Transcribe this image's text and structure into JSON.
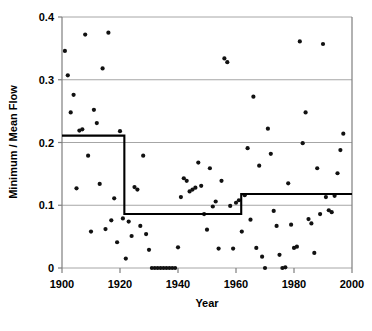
{
  "chart_data": {
    "type": "scatter",
    "title": "",
    "xlabel": "Year",
    "ylabel": "Minimum / Mean Flow",
    "xlim": [
      1900,
      2000
    ],
    "ylim": [
      0,
      0.4
    ],
    "xticks": [
      "1900",
      "1920",
      "1940",
      "1960",
      "1980",
      "2000"
    ],
    "xtick_values": [
      1900,
      1920,
      1940,
      1960,
      1980,
      2000
    ],
    "yticks": [
      "0",
      "0.1",
      "0.2",
      "0.3",
      "0.4"
    ],
    "ytick_values": [
      0,
      0.1,
      0.2,
      0.3,
      0.4
    ],
    "grid": "horizontal",
    "legend": "none",
    "series": [
      {
        "name": "Minimum / Mean Flow",
        "marker": "filled-circle",
        "color": "#111111",
        "points": [
          [
            1901,
            0.346
          ],
          [
            1902,
            0.307
          ],
          [
            1903,
            0.248
          ],
          [
            1904,
            0.276
          ],
          [
            1905,
            0.127
          ],
          [
            1906,
            0.219
          ],
          [
            1907,
            0.221
          ],
          [
            1908,
            0.372
          ],
          [
            1909,
            0.179
          ],
          [
            1910,
            0.058
          ],
          [
            1911,
            0.252
          ],
          [
            1912,
            0.231
          ],
          [
            1913,
            0.134
          ],
          [
            1914,
            0.318
          ],
          [
            1915,
            0.062
          ],
          [
            1916,
            0.375
          ],
          [
            1917,
            0.076
          ],
          [
            1918,
            0.111
          ],
          [
            1919,
            0.041
          ],
          [
            1920,
            0.218
          ],
          [
            1921,
            0.079
          ],
          [
            1922,
            0.015
          ],
          [
            1923,
            0.074
          ],
          [
            1924,
            0.051
          ],
          [
            1925,
            0.129
          ],
          [
            1926,
            0.125
          ],
          [
            1927,
            0.067
          ],
          [
            1928,
            0.179
          ],
          [
            1929,
            0.054
          ],
          [
            1930,
            0.029
          ],
          [
            1931,
            0.0
          ],
          [
            1932,
            0.0
          ],
          [
            1933,
            0.0
          ],
          [
            1934,
            0.0
          ],
          [
            1935,
            0.0
          ],
          [
            1936,
            0.0
          ],
          [
            1937,
            0.0
          ],
          [
            1938,
            0.0
          ],
          [
            1939,
            0.0
          ],
          [
            1940,
            0.033
          ],
          [
            1941,
            0.113
          ],
          [
            1942,
            0.143
          ],
          [
            1943,
            0.139
          ],
          [
            1944,
            0.122
          ],
          [
            1945,
            0.125
          ],
          [
            1946,
            0.128
          ],
          [
            1947,
            0.168
          ],
          [
            1948,
            0.131
          ],
          [
            1949,
            0.086
          ],
          [
            1950,
            0.061
          ],
          [
            1951,
            0.159
          ],
          [
            1952,
            0.098
          ],
          [
            1953,
            0.106
          ],
          [
            1954,
            0.031
          ],
          [
            1955,
            0.139
          ],
          [
            1956,
            0.334
          ],
          [
            1957,
            0.328
          ],
          [
            1958,
            0.099
          ],
          [
            1959,
            0.031
          ],
          [
            1960,
            0.104
          ],
          [
            1961,
            0.108
          ],
          [
            1962,
            0.058
          ],
          [
            1963,
            0.116
          ],
          [
            1964,
            0.191
          ],
          [
            1965,
            0.077
          ],
          [
            1966,
            0.273
          ],
          [
            1967,
            0.032
          ],
          [
            1968,
            0.163
          ],
          [
            1969,
            0.018
          ],
          [
            1970,
            0.0
          ],
          [
            1971,
            0.222
          ],
          [
            1972,
            0.182
          ],
          [
            1973,
            0.091
          ],
          [
            1974,
            0.067
          ],
          [
            1975,
            0.021
          ],
          [
            1976,
            0.0
          ],
          [
            1977,
            0.001
          ],
          [
            1978,
            0.135
          ],
          [
            1979,
            0.069
          ],
          [
            1980,
            0.032
          ],
          [
            1981,
            0.034
          ],
          [
            1982,
            0.361
          ],
          [
            1983,
            0.199
          ],
          [
            1984,
            0.248
          ],
          [
            1985,
            0.078
          ],
          [
            1986,
            0.071
          ],
          [
            1987,
            0.024
          ],
          [
            1988,
            0.159
          ],
          [
            1989,
            0.086
          ],
          [
            1990,
            0.357
          ],
          [
            1991,
            0.113
          ],
          [
            1992,
            0.092
          ],
          [
            1993,
            0.089
          ],
          [
            1994,
            0.115
          ],
          [
            1995,
            0.151
          ],
          [
            1996,
            0.188
          ],
          [
            1997,
            0.214
          ]
        ]
      }
    ],
    "step_function": {
      "name": "step-change regression",
      "color": "#000000",
      "segments": [
        {
          "x_start": 1900,
          "x_end": 1921.5,
          "level": 0.211
        },
        {
          "x_start": 1921.5,
          "x_end": 1961.8,
          "level": 0.086
        },
        {
          "x_start": 1961.8,
          "x_end": 2000,
          "level": 0.118
        }
      ]
    }
  },
  "axes": {
    "y_title": "Minimum / Mean Flow",
    "x_title": "Year"
  }
}
